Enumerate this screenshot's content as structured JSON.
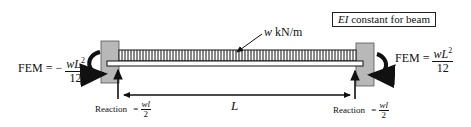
{
  "diagram": {
    "title_box": {
      "italic": "EI",
      "text": " constant for beam"
    },
    "load_label": {
      "italic": "w",
      "text": " kN/m"
    },
    "span_label": "L",
    "left_fem": {
      "prefix": "FEM = −",
      "num_italic": "wL",
      "num_sup": "2",
      "den": "12"
    },
    "right_fem": {
      "prefix": "FEM = ",
      "num_italic": "wL",
      "num_sup": "2",
      "den": "12"
    },
    "left_reaction": {
      "label": "Reaction",
      "eq": "=",
      "num": "wl",
      "den": "2"
    },
    "right_reaction": {
      "label": "Reaction",
      "eq": "=",
      "num": "wl",
      "den": "2"
    },
    "colors": {
      "support": "#b8b8b8",
      "line": "#111111",
      "background": "#ffffff"
    }
  }
}
